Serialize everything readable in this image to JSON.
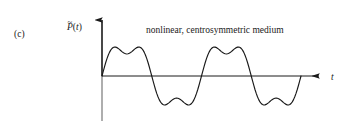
{
  "figure": {
    "panel_label": "(c)",
    "caption": "nonlinear, centrosymmetric medium",
    "y_axis_label": {
      "symbol": "P",
      "accent": "~",
      "open_paren": "(",
      "variable": "t",
      "close_paren": ")"
    },
    "x_axis_label": "t",
    "colors": {
      "background": "#ffffff",
      "curve": "#1a1a1a",
      "axis": "#1a1a1a",
      "axis_below_origin": "#9a9a9a",
      "text": "#1a1a1a"
    }
  },
  "chart_data": {
    "type": "line",
    "title": "nonlinear, centrosymmetric medium",
    "xlabel": "t",
    "ylabel": "P~(t)",
    "grid": false,
    "legend": null,
    "xlim": [
      0,
      2.05
    ],
    "ylim": [
      -1.08,
      1.08
    ],
    "axis_origin_px": {
      "x": 102,
      "y": 76
    },
    "px_per_unit_x": 99.5,
    "px_per_unit_y": 31.5,
    "waveform": {
      "form": "sin(2*pi*x) + 0.30*sin(6*pi*x)",
      "fundamental_periods": 2,
      "harmonic_content": [
        "fundamental",
        "third harmonic"
      ],
      "third_harmonic_amplitude": 0.3,
      "second_harmonic_amplitude": 0,
      "peak_value": 1.0,
      "trough_value": -1.0,
      "symmetric": true
    },
    "x": [
      0,
      0.05,
      0.1,
      0.15,
      0.2,
      0.25,
      0.3,
      0.35,
      0.4,
      0.45,
      0.5,
      0.55,
      0.6,
      0.65,
      0.7,
      0.75,
      0.8,
      0.85,
      0.9,
      0.95,
      1.0,
      1.05,
      1.1,
      1.15,
      1.2,
      1.25,
      1.3,
      1.35,
      1.4,
      1.45,
      1.5,
      1.55,
      1.6,
      1.65,
      1.7,
      1.75,
      1.8,
      1.85,
      1.9,
      1.95,
      2.0
    ],
    "y": [
      0.0,
      0.52,
      0.87,
      0.99,
      0.93,
      0.78,
      0.64,
      0.59,
      0.64,
      0.72,
      0.0,
      -0.72,
      -0.64,
      -0.59,
      -0.64,
      -0.78,
      -0.93,
      -0.99,
      -0.87,
      -0.52,
      0.0,
      0.52,
      0.87,
      0.99,
      0.93,
      0.78,
      0.64,
      0.59,
      0.64,
      0.72,
      0.0,
      -0.72,
      -0.64,
      -0.59,
      -0.64,
      -0.78,
      -0.93,
      -0.99,
      -0.87,
      -0.52,
      0.0
    ],
    "key_points": {
      "zero_crossings_x": [
        0,
        0.5,
        1.0,
        1.5,
        2.0
      ],
      "maxima_x": [
        0.15,
        1.15
      ],
      "minima_x": [
        0.85,
        1.85
      ],
      "maxima_y": [
        1.0,
        1.0
      ],
      "minima_y": [
        -1.0,
        -1.0
      ]
    }
  }
}
